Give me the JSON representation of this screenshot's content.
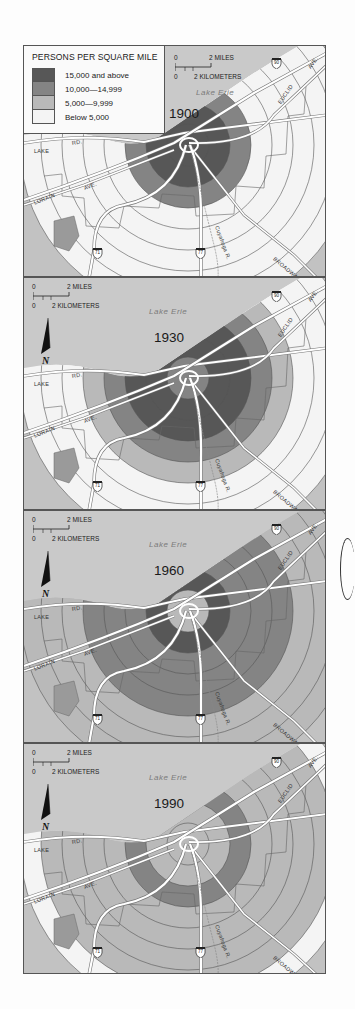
{
  "legend": {
    "title": "PERSONS PER SQUARE MILE",
    "classes": [
      {
        "label": "15,000 and above",
        "color": "#575757"
      },
      {
        "label": "10,000—14,999",
        "color": "#848484"
      },
      {
        "label": "5,000—9,999",
        "color": "#b9b9b9"
      },
      {
        "label": "Below 5,000",
        "color": "#f4f4f4"
      }
    ]
  },
  "scale": {
    "miles_zero": "0",
    "miles_label": "2 MILES",
    "km_zero": "0",
    "km_label": "2 KILOMETERS"
  },
  "north_arrow": {
    "label": "N"
  },
  "water_label": "Lake Erie",
  "road_labels": {
    "lake_rd_1": "LAKE",
    "lake_rd_2": "RD.",
    "lorain_1": "LORAIN",
    "lorain_2": "AVE.",
    "euclid_1": "EUCLID",
    "euclid_2": "AVE.",
    "broadway": "BROADWAY",
    "river": "Cuyahoga R."
  },
  "interstates": [
    "90",
    "71",
    "77"
  ],
  "colors": {
    "water": "#c9c9c9",
    "land": "#c2c2c2",
    "road": "#ffffff",
    "boundary": "#555555"
  },
  "chart_data": {
    "type": "choropleth-rings",
    "years": [
      "1900",
      "1930",
      "1960",
      "1990"
    ],
    "ring_count": 8,
    "classes": [
      "15,000 and above",
      "10,000—14,999",
      "5,000—9,999",
      "Below 5,000"
    ],
    "rings_by_year": {
      "1900": [
        "15,000 and above",
        "15,000 and above",
        "10,000—14,999",
        "Below 5,000",
        "Below 5,000",
        "Below 5,000",
        "Below 5,000",
        "Below 5,000"
      ],
      "1930": [
        "10,000—14,999",
        "15,000 and above",
        "15,000 and above",
        "10,000—14,999",
        "5,000—9,999",
        "Below 5,000",
        "Below 5,000",
        "Below 5,000"
      ],
      "1960": [
        "5,000—9,999",
        "15,000 and above",
        "10,000—14,999",
        "10,000—14,999",
        "10,000—14,999",
        "5,000—9,999",
        "5,000—9,999",
        "5,000—9,999"
      ],
      "1990": [
        "5,000—9,999",
        "5,000—9,999",
        "10,000—14,999",
        "5,000—9,999",
        "5,000—9,999",
        "5,000—9,999",
        "5,000—9,999",
        "Below 5,000"
      ]
    }
  },
  "panels": [
    {
      "year": "1900"
    },
    {
      "year": "1930"
    },
    {
      "year": "1960"
    },
    {
      "year": "1990"
    }
  ]
}
